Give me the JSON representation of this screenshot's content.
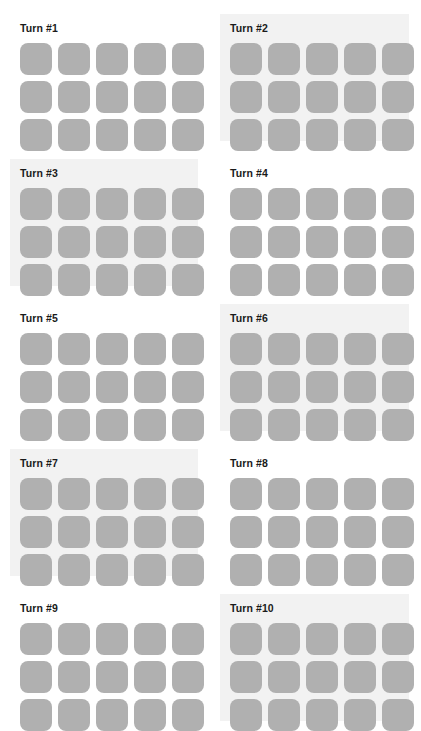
{
  "page": {
    "width": 421,
    "height": 725,
    "background_color": "#ffffff",
    "columns": 2,
    "rows": 5
  },
  "style": {
    "tile_color": "#b0b0b0",
    "highlight_background_color": "#f2f2f2",
    "plain_background_color": "#ffffff",
    "label_color": "#1a1a1a",
    "tile_corner_radius_px": 8,
    "tile_size_px": 32,
    "tile_gap_px": 6
  },
  "grid_spec": {
    "tile_columns": 5,
    "tile_rows": 3,
    "tiles_per_panel": 15
  },
  "panels": [
    {
      "index": 1,
      "label": "Turn #1",
      "highlighted": false,
      "tiles": [
        "tile",
        "tile",
        "tile",
        "tile",
        "tile",
        "tile",
        "tile",
        "tile",
        "tile",
        "tile",
        "tile",
        "tile",
        "tile",
        "tile",
        "tile"
      ]
    },
    {
      "index": 2,
      "label": "Turn #2",
      "highlighted": true,
      "tiles": [
        "tile",
        "tile",
        "tile",
        "tile",
        "tile",
        "tile",
        "tile",
        "tile",
        "tile",
        "tile",
        "tile",
        "tile",
        "tile",
        "tile",
        "tile"
      ]
    },
    {
      "index": 3,
      "label": "Turn #3",
      "highlighted": true,
      "tiles": [
        "tile",
        "tile",
        "tile",
        "tile",
        "tile",
        "tile",
        "tile",
        "tile",
        "tile",
        "tile",
        "tile",
        "tile",
        "tile",
        "tile",
        "tile"
      ]
    },
    {
      "index": 4,
      "label": "Turn #4",
      "highlighted": false,
      "tiles": [
        "tile",
        "tile",
        "tile",
        "tile",
        "tile",
        "tile",
        "tile",
        "tile",
        "tile",
        "tile",
        "tile",
        "tile",
        "tile",
        "tile",
        "tile"
      ]
    },
    {
      "index": 5,
      "label": "Turn #5",
      "highlighted": false,
      "tiles": [
        "tile",
        "tile",
        "tile",
        "tile",
        "tile",
        "tile",
        "tile",
        "tile",
        "tile",
        "tile",
        "tile",
        "tile",
        "tile",
        "tile",
        "tile"
      ]
    },
    {
      "index": 6,
      "label": "Turn #6",
      "highlighted": true,
      "tiles": [
        "tile",
        "tile",
        "tile",
        "tile",
        "tile",
        "tile",
        "tile",
        "tile",
        "tile",
        "tile",
        "tile",
        "tile",
        "tile",
        "tile",
        "tile"
      ]
    },
    {
      "index": 7,
      "label": "Turn #7",
      "highlighted": true,
      "tiles": [
        "tile",
        "tile",
        "tile",
        "tile",
        "tile",
        "tile",
        "tile",
        "tile",
        "tile",
        "tile",
        "tile",
        "tile",
        "tile",
        "tile",
        "tile"
      ]
    },
    {
      "index": 8,
      "label": "Turn #8",
      "highlighted": false,
      "tiles": [
        "tile",
        "tile",
        "tile",
        "tile",
        "tile",
        "tile",
        "tile",
        "tile",
        "tile",
        "tile",
        "tile",
        "tile",
        "tile",
        "tile",
        "tile"
      ]
    },
    {
      "index": 9,
      "label": "Turn #9",
      "highlighted": false,
      "tiles": [
        "tile",
        "tile",
        "tile",
        "tile",
        "tile",
        "tile",
        "tile",
        "tile",
        "tile",
        "tile",
        "tile",
        "tile",
        "tile",
        "tile",
        "tile"
      ]
    },
    {
      "index": 10,
      "label": "Turn #10",
      "highlighted": true,
      "tiles": [
        "tile",
        "tile",
        "tile",
        "tile",
        "tile",
        "tile",
        "tile",
        "tile",
        "tile",
        "tile",
        "tile",
        "tile",
        "tile",
        "tile",
        "tile"
      ]
    }
  ]
}
